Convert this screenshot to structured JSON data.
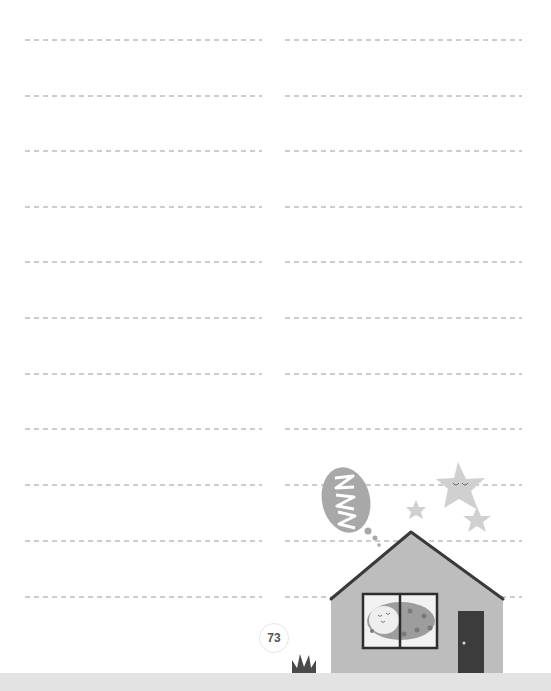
{
  "page": {
    "type": "writing-lines-page",
    "page_number": "73",
    "line_rows": [
      39,
      95,
      150,
      206,
      261,
      317,
      373,
      428,
      484,
      540,
      596
    ],
    "columns": [
      "left",
      "right"
    ]
  },
  "illustration": {
    "description": "sleeping house at night",
    "elements": [
      "speech-bubble-zzz",
      "star-with-sleeping-face",
      "small-star",
      "small-star",
      "house",
      "window-with-sleeping-figure",
      "door",
      "grass-tuft"
    ],
    "bubble_text": "ZZZ"
  },
  "colors": {
    "line": "#c4c4c4",
    "house_wall": "#bdbdbd",
    "roof_outline": "#3a3a3a",
    "door": "#3c3c3c",
    "star": "#cfcfcf",
    "bubble": "#a8a8a8",
    "ground": "#e3e3e3",
    "grass": "#4a4a4a"
  }
}
